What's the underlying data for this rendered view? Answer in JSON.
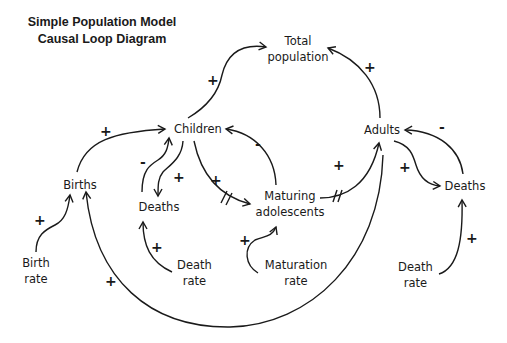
{
  "title": {
    "line1": "Simple Population Model",
    "line2": "Causal Loop Diagram"
  },
  "nodes": {
    "total_population": {
      "line1": "Total",
      "line2": "population"
    },
    "children": {
      "label": "Children"
    },
    "adults": {
      "label": "Adults"
    },
    "births": {
      "label": "Births"
    },
    "child_deaths": {
      "label": "Deaths"
    },
    "adult_deaths": {
      "label": "Deaths"
    },
    "maturing": {
      "line1": "Maturing",
      "line2": "adolescents"
    },
    "birth_rate": {
      "line1": "Birth",
      "line2": "rate"
    },
    "child_death_rate": {
      "line1": "Death",
      "line2": "rate"
    },
    "maturation_rate": {
      "line1": "Maturation",
      "line2": "rate"
    },
    "adult_death_rate": {
      "line1": "Death",
      "line2": "rate"
    }
  },
  "links": [
    {
      "from": "Children",
      "to": "Total population",
      "polarity": "+"
    },
    {
      "from": "Adults",
      "to": "Total population",
      "polarity": "+"
    },
    {
      "from": "Births",
      "to": "Children",
      "polarity": "+"
    },
    {
      "from": "Children",
      "to": "Deaths",
      "polarity": "+"
    },
    {
      "from": "Deaths",
      "to": "Children",
      "polarity": "-"
    },
    {
      "from": "Children",
      "to": "Maturing adolescents",
      "polarity": "+",
      "delay": true
    },
    {
      "from": "Maturing adolescents",
      "to": "Children",
      "polarity": "-"
    },
    {
      "from": "Maturing adolescents",
      "to": "Adults",
      "polarity": "+",
      "delay": true
    },
    {
      "from": "Adults",
      "to": "Deaths",
      "polarity": "+"
    },
    {
      "from": "Deaths",
      "to": "Adults",
      "polarity": "-"
    },
    {
      "from": "Birth rate",
      "to": "Births",
      "polarity": "+"
    },
    {
      "from": "Adults",
      "to": "Births",
      "polarity": "+"
    },
    {
      "from": "Death rate",
      "to": "Deaths",
      "polarity": "+"
    },
    {
      "from": "Maturation rate",
      "to": "Maturing adolescents",
      "polarity": "+"
    },
    {
      "from": "Death rate",
      "to": "Deaths (adult)",
      "polarity": "+"
    }
  ],
  "signs": {
    "children_total": "+",
    "adults_total": "+",
    "births_children": "+",
    "deaths_children": "-",
    "children_deaths": "+",
    "children_maturing": "+",
    "maturing_children": "-",
    "maturing_adults": "+",
    "adults_deaths": "+",
    "deaths_adults": "-",
    "birthrate_births": "+",
    "adults_births": "+",
    "deathrate_deaths": "+",
    "maturationrate_maturing": "+",
    "adultdeathrate_deaths": "+"
  }
}
